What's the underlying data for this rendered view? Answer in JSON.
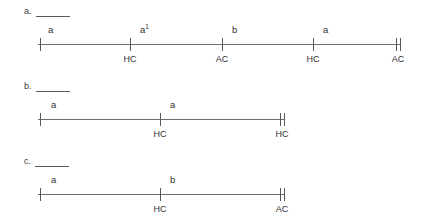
{
  "figure": {
    "type": "number-line-diagram",
    "line_color": "#6e6e70",
    "text_color": "#2f2f2f",
    "background": "#ffffff"
  },
  "sections": [
    {
      "id": "a",
      "prompt_label": "a.",
      "answer_blank": "",
      "line": {
        "left": 38,
        "right": 400,
        "top": 28
      },
      "end_marker": "double-tick",
      "ticks": [
        {
          "x": 40,
          "label": "",
          "style": "single"
        },
        {
          "x": 130,
          "label": "HC",
          "style": "single"
        },
        {
          "x": 222,
          "label": "AC",
          "style": "single"
        },
        {
          "x": 313,
          "label": "HC",
          "style": "single"
        },
        {
          "x": 399,
          "label": "AC",
          "style": "double"
        }
      ],
      "segments": [
        {
          "label": "a",
          "sup": "",
          "x": 48
        },
        {
          "label": "a",
          "sup": "1",
          "x": 140
        },
        {
          "label": "b",
          "sup": "",
          "x": 232
        },
        {
          "label": "a",
          "sup": "",
          "x": 323
        }
      ]
    },
    {
      "id": "b",
      "prompt_label": "b.",
      "answer_blank": "",
      "line": {
        "left": 38,
        "right": 284,
        "top": 103
      },
      "end_marker": "double-tick",
      "ticks": [
        {
          "x": 40,
          "label": "",
          "style": "single"
        },
        {
          "x": 160,
          "label": "HC",
          "style": "single"
        },
        {
          "x": 283,
          "label": "HC",
          "style": "double"
        }
      ],
      "segments": [
        {
          "label": "a",
          "sup": "",
          "x": 51
        },
        {
          "label": "a",
          "sup": "",
          "x": 170
        }
      ]
    },
    {
      "id": "c",
      "prompt_label": "c.",
      "answer_blank": "",
      "line": {
        "left": 38,
        "right": 284,
        "top": 178
      },
      "end_marker": "double-tick",
      "ticks": [
        {
          "x": 40,
          "label": "",
          "style": "single"
        },
        {
          "x": 160,
          "label": "HC",
          "style": "single"
        },
        {
          "x": 283,
          "label": "AC",
          "style": "double"
        }
      ],
      "segments": [
        {
          "label": "a",
          "sup": "",
          "x": 51
        },
        {
          "label": "b",
          "sup": "",
          "x": 170
        }
      ]
    }
  ],
  "prompt_offsets": [
    {
      "id": "a",
      "top": 6
    },
    {
      "id": "b",
      "top": 81
    },
    {
      "id": "c",
      "top": 156
    }
  ]
}
